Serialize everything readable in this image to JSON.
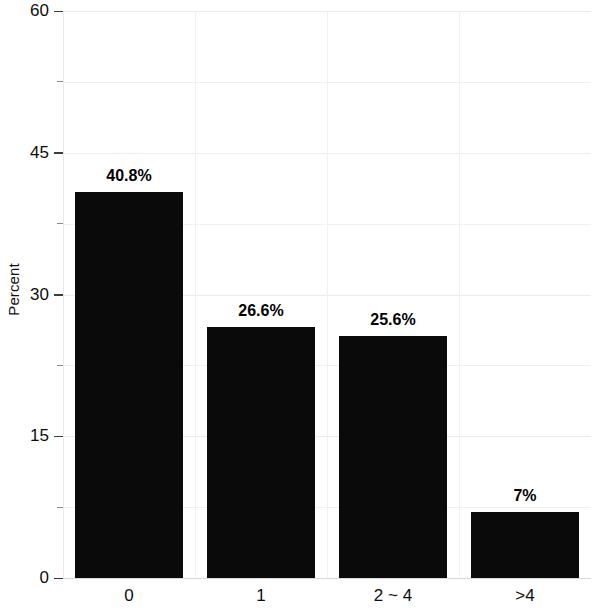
{
  "chart_data": {
    "type": "bar",
    "title": "",
    "xlabel": "",
    "ylabel": "Percent",
    "categories": [
      "0",
      "1",
      "2 ~ 4",
      ">4"
    ],
    "values": [
      40.8,
      26.6,
      25.6,
      7
    ],
    "data_labels": [
      "40.8%",
      "26.6%",
      "25.6%",
      "7%"
    ],
    "ylim": [
      0,
      60
    ],
    "ytick_labels": [
      "0",
      "15",
      "30",
      "45",
      "60"
    ],
    "ytick_values": [
      0,
      15,
      30,
      45,
      60
    ],
    "yminor_values": [
      7.5,
      22.5,
      37.5,
      52.5
    ],
    "grid": true,
    "legend": "none",
    "bar_color": "#0a0a0a",
    "background_color": "#ffffff",
    "grid_color": "#f0f0f0"
  }
}
